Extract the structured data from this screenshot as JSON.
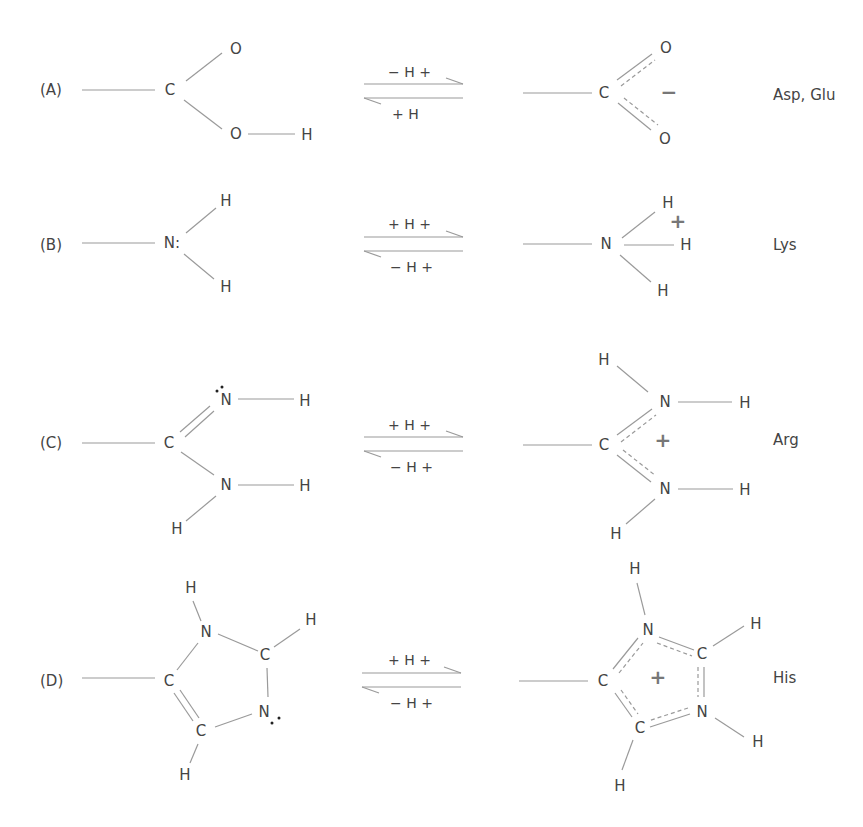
{
  "rows": [
    {
      "label": "(A)",
      "residues": "Asp, Glu",
      "arrow_top": "− H +",
      "arrow_bottom": "+ H",
      "left_atoms": {
        "center": "C",
        "top": "O",
        "bottom": "O",
        "bottom_h": "H"
      },
      "right_atoms": {
        "center": "C",
        "top": "O",
        "bottom": "O"
      },
      "right_charge": "−"
    },
    {
      "label": "(B)",
      "residues": "Lys",
      "arrow_top": "+ H +",
      "arrow_bottom": "− H +",
      "left_atoms": {
        "center": "N:",
        "top": "H",
        "bottom": "H"
      },
      "right_atoms": {
        "center": "N",
        "top": "H",
        "middle": "H",
        "bottom": "H"
      },
      "right_charge": "+"
    },
    {
      "label": "(C)",
      "residues": "Arg",
      "arrow_top": "+ H +",
      "arrow_bottom": "− H +",
      "left_atoms": {
        "center": "C",
        "n_top": "N",
        "n_top_h": "H",
        "n_bottom": "N",
        "n_bottom_h": "H",
        "n_bottom_h2": "H"
      },
      "right_atoms": {
        "center": "C",
        "n_top": "N",
        "n_top_h": "H",
        "n_top_h2": "H",
        "n_bottom": "N",
        "n_bottom_h": "H",
        "n_bottom_h2": "H"
      },
      "right_charge": "+"
    },
    {
      "label": "(D)",
      "residues": "His",
      "arrow_top": "+ H +",
      "arrow_bottom": "− H +",
      "left_atoms": {
        "c1": "C",
        "n1": "N",
        "n1_h": "H",
        "c2": "C",
        "c2_h": "H",
        "n2": "N",
        "c3": "C",
        "c3_h": "H"
      },
      "right_atoms": {
        "c1": "C",
        "n1": "N",
        "n1_h": "H",
        "c2": "C",
        "c2_h": "H",
        "n2": "N",
        "n2_h": "H",
        "c3": "C",
        "c3_h": "H"
      },
      "right_charge": "+"
    }
  ]
}
